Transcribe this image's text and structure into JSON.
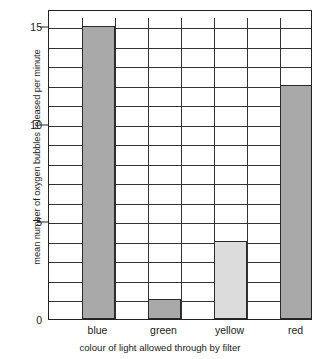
{
  "chart_data": {
    "type": "bar",
    "title": "",
    "categories": [
      "blue",
      "green",
      "yellow",
      "red"
    ],
    "values": [
      15,
      1,
      4,
      12
    ],
    "series": [
      {
        "name": "mean number of oxygen bubbles released per minute",
        "values": [
          15,
          1,
          4,
          12
        ]
      }
    ],
    "bar_colors": [
      "#a9a9a9",
      "#a9a9a9",
      "#dcdcdc",
      "#a9a9a9"
    ],
    "bar_border_color": "#2a2a2a",
    "xlabel": "colour of light allowed through by filter",
    "ylabel": "mean number of oxygen bubbles released per minute",
    "ylim": [
      0,
      15.5
    ],
    "xlim": [
      0,
      4
    ],
    "y_major_ticks": [
      0,
      5,
      10,
      15
    ],
    "y_major_tick_labels": [
      "0",
      "5",
      "10",
      "15"
    ],
    "y_minor_tick_step": 1,
    "grid": "horizontal-and-vertical",
    "gridline_color": "#333333",
    "legend": "none",
    "axis_frame_color": "#222222",
    "background_color": "#ffffff"
  },
  "axes": {
    "y_title": "mean number of oxygen bubbles released per minute",
    "x_title": "colour of light allowed through by filter"
  }
}
